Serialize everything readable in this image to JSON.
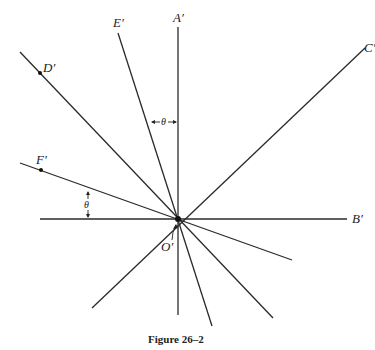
{
  "figure": {
    "caption": "Figure 26–2",
    "origin_label": "O′",
    "angle_symbol": "θ",
    "rays": [
      {
        "name": "ray-a",
        "label": "A′"
      },
      {
        "name": "ray-b",
        "label": "B′"
      },
      {
        "name": "ray-c",
        "label": "C′"
      },
      {
        "name": "ray-d",
        "label": "D′",
        "has_point": true
      },
      {
        "name": "ray-e",
        "label": "E′"
      },
      {
        "name": "ray-f",
        "label": "F′",
        "has_point": true
      }
    ]
  }
}
